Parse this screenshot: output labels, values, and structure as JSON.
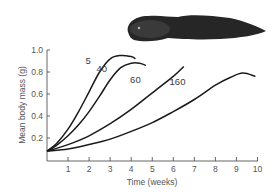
{
  "chart_data": {
    "type": "line",
    "title": "",
    "xlabel": "Time (weeks)",
    "ylabel": "Mean body mass (g)",
    "xlim": [
      0,
      10
    ],
    "ylim": [
      0,
      1.0
    ],
    "x_ticks": [
      1,
      2,
      3,
      4,
      5,
      6,
      7,
      8,
      9,
      10
    ],
    "y_ticks": [
      0.2,
      0.4,
      0.6,
      0.8,
      1.0
    ],
    "y_tick_labels": [
      "0.2",
      "0.4",
      "0.6",
      "0.8",
      "1.0"
    ],
    "x_tick_labels": [
      "1",
      "2",
      "3",
      "4",
      "5",
      "6",
      "7",
      "8",
      "9",
      "10"
    ],
    "grid": false,
    "legend": "inline labels on curves",
    "series": [
      {
        "name": "5",
        "x": [
          0,
          0.5,
          1.0,
          1.5,
          2.0,
          2.5,
          3.0,
          3.5,
          4.0,
          4.2
        ],
        "values": [
          0.08,
          0.16,
          0.28,
          0.44,
          0.62,
          0.8,
          0.92,
          0.95,
          0.94,
          0.92
        ],
        "label_pos": [
          1.95,
          0.87
        ]
      },
      {
        "name": "40",
        "x": [
          0,
          0.5,
          1.0,
          1.5,
          2.0,
          2.5,
          3.0,
          3.5,
          4.0,
          4.4,
          4.7
        ],
        "values": [
          0.08,
          0.14,
          0.22,
          0.32,
          0.44,
          0.58,
          0.73,
          0.84,
          0.88,
          0.88,
          0.86
        ],
        "label_pos": [
          2.6,
          0.8
        ]
      },
      {
        "name": "60",
        "x": [
          0,
          1,
          2,
          3,
          4,
          5,
          6,
          6.5
        ],
        "values": [
          0.08,
          0.14,
          0.22,
          0.33,
          0.46,
          0.61,
          0.76,
          0.85
        ],
        "label_pos": [
          4.2,
          0.7
        ]
      },
      {
        "name": "160",
        "x": [
          0,
          1,
          2,
          3,
          4,
          5,
          6,
          7,
          8,
          8.7,
          9.3,
          9.9
        ],
        "values": [
          0.08,
          0.1,
          0.14,
          0.19,
          0.26,
          0.34,
          0.44,
          0.55,
          0.68,
          0.75,
          0.79,
          0.76
        ],
        "label_pos": [
          6.2,
          0.68
        ]
      }
    ],
    "annotations": [
      "tadpole illustration (top right)"
    ]
  },
  "colors": {
    "curve": "#1a1a1a",
    "axis": "#555555",
    "tadpole_body": "#2a2a2a",
    "tadpole_head": "#3c3c3c"
  }
}
